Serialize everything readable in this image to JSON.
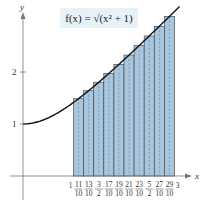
{
  "chart_data": {
    "type": "bar",
    "title": "f(x) = √(x² + 1)",
    "xlabel": "x",
    "ylabel": "y",
    "xlim": [
      0,
      3
    ],
    "ylim": [
      0,
      3.2
    ],
    "grid": false,
    "x_ticks": [
      "1",
      "11/10",
      "13/10",
      "3/2",
      "17/10",
      "19/10",
      "21/10",
      "23/10",
      "5/2",
      "27/10",
      "29/10",
      "3"
    ],
    "y_ticks": [
      "1",
      "2"
    ],
    "bar_width": 0.2,
    "categories": [
      1.1,
      1.3,
      1.5,
      1.7,
      1.9,
      2.1,
      2.3,
      2.5,
      2.7,
      2.9
    ],
    "values": [
      1.487,
      1.64,
      1.803,
      1.972,
      2.147,
      2.326,
      2.508,
      2.693,
      2.879,
      3.068
    ],
    "curve": {
      "name": "f(x) = √(x² + 1)",
      "x_range": [
        0,
        3.1
      ]
    },
    "colors": {
      "bar_fill": "#a9c6df",
      "bar_stroke": "#4a4a4a",
      "curve": "#111111",
      "formula_bg": "#e6f1f8"
    }
  },
  "formula": {
    "label": "f(x) = √(x² + 1)"
  },
  "axes": {
    "x_label": "x",
    "y_label": "y",
    "y_tick_1": "1",
    "y_tick_2": "2"
  }
}
